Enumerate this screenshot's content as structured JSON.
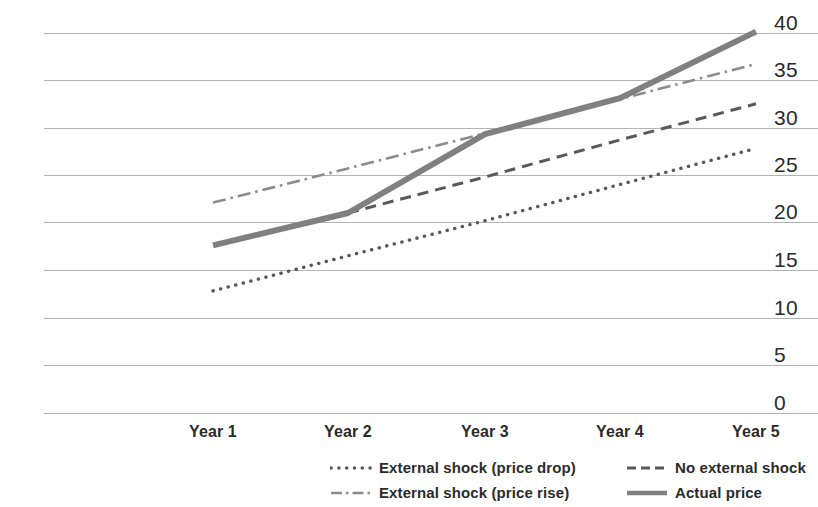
{
  "chart_data": {
    "type": "line",
    "title": "",
    "xlabel": "",
    "ylabel": "",
    "categories": [
      "Year 1",
      "Year 2",
      "Year 3",
      "Year 4",
      "Year 5"
    ],
    "ylim": [
      0,
      40
    ],
    "yticks": [
      "0",
      "5",
      "10",
      "15",
      "20",
      "25",
      "30",
      "35",
      "40"
    ],
    "grid": true,
    "legend_position": "bottom-right",
    "series": [
      {
        "name": "External shock (price drop)",
        "style": "dotted",
        "color": "#595959",
        "x": [
          "Year 1",
          "Year 2",
          "Year 3",
          "Year 4",
          "Year 5"
        ],
        "values": [
          12.9,
          16.6,
          20.3,
          24.1,
          27.9
        ]
      },
      {
        "name": "No external shock",
        "style": "dashed",
        "color": "#595959",
        "x": [
          "Year 2",
          "Year 3",
          "Year 4",
          "Year 5"
        ],
        "values": [
          21.1,
          24.9,
          28.8,
          32.6
        ]
      },
      {
        "name": "External shock (price rise)",
        "style": "dash-dot",
        "color": "#8c8c8c",
        "x": [
          "Year 1",
          "Year 2",
          "Year 3",
          "Year 4",
          "Year 5"
        ],
        "values": [
          22.2,
          25.8,
          29.5,
          33.1,
          36.8
        ]
      },
      {
        "name": "Actual price",
        "style": "solid",
        "color": "#808080",
        "x": [
          "Year 1",
          "Year 2",
          "Year 3",
          "Year 4",
          "Year 5"
        ],
        "values": [
          17.7,
          21.1,
          29.4,
          33.2,
          40.2
        ]
      }
    ]
  },
  "axis": {
    "y_labels": [
      "40",
      "35",
      "30",
      "25",
      "20",
      "15",
      "10",
      "5",
      "0"
    ],
    "x_labels": [
      "Year 1",
      "Year 2",
      "Year 3",
      "Year 4",
      "Year 5"
    ]
  },
  "legend": {
    "rows": [
      [
        {
          "label": "External shock (price drop)",
          "style": "dotted"
        },
        {
          "label": "No external shock",
          "style": "dashed"
        }
      ],
      [
        {
          "label": "External shock (price rise)",
          "style": "dash-dot"
        },
        {
          "label": "Actual price",
          "style": "solid"
        }
      ]
    ]
  },
  "colors": {
    "grid": "#b3b3b3",
    "axis_text": "#2b2b2b",
    "series_dark": "#595959",
    "series_light": "#8c8c8c",
    "series_actual": "#808080"
  }
}
